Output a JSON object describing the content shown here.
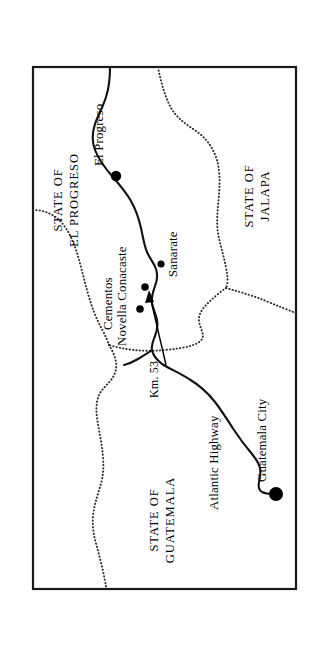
{
  "map": {
    "title": "Location map of Cementos Novella Conacaste plant, Guatemala",
    "orientation_note": "landscape map rotated 90 degrees counter-clockwise on the page",
    "frame": {
      "x": 33,
      "y": 67,
      "width": 263,
      "height": 522,
      "stroke_color": "#1a1a1a"
    },
    "background_color": "#ffffff",
    "ink_color": "#000000",
    "state_labels": [
      {
        "id": "state-el-progreso",
        "line1": "STATE OF",
        "line2": "EL PROGRESO",
        "anchor_x": 62,
        "anchor_y": 200,
        "rotation": -90
      },
      {
        "id": "state-jalapa",
        "line1": "STATE OF",
        "line2": "JALAPA",
        "anchor_x": 253,
        "anchor_y": 196,
        "rotation": -90
      },
      {
        "id": "state-guatemala",
        "line1": "STATE OF",
        "line2": "GUATEMALA",
        "anchor_x": 158,
        "anchor_y": 520,
        "rotation": -90
      }
    ],
    "places": [
      {
        "id": "el-progreso",
        "label": "El Progreso",
        "dot_x": 116,
        "dot_y": 176,
        "dot_radius": 5.2,
        "label_x": 103,
        "label_y": 166,
        "rotation": -90
      },
      {
        "id": "sanarate",
        "label": "Sanarate",
        "dot_x": 161,
        "dot_y": 264,
        "dot_radius": 3.6,
        "label_x": 177,
        "label_y": 277,
        "rotation": -90
      },
      {
        "id": "guatemala-city",
        "label": "Guatemala City",
        "dot_x": 276,
        "dot_y": 494,
        "dot_radius": 7.0,
        "label_x": 266,
        "label_y": 482,
        "rotation": -90
      }
    ],
    "plant": {
      "id": "cementos-novella-conacaste",
      "line1": "Cementos",
      "line2": "Novella Conacaste",
      "label1_x": 112,
      "label1_y": 330,
      "label2_x": 126,
      "label2_y": 346,
      "rotation": -90,
      "dot_x": 145,
      "dot_y": 287,
      "dot_radius": 3.8,
      "secondary_dot_x": 140,
      "secondary_dot_y": 309,
      "secondary_dot_radius": 3.8
    },
    "road_markers": [
      {
        "id": "km-53",
        "label": "Km. 53",
        "label_x": 158,
        "label_y": 398,
        "rotation": -90
      }
    ],
    "roads": [
      {
        "id": "atlantic-highway",
        "label": "Atlantic Highway",
        "label_x": 218,
        "label_y": 510,
        "rotation": -90
      }
    ],
    "legend_notes": {
      "solid_line_meaning": "highway / main road",
      "dotted_line_meaning": "state boundary",
      "filled_circle_meaning": "town or city",
      "arrow_meaning": "pointer to cement plant site"
    }
  }
}
